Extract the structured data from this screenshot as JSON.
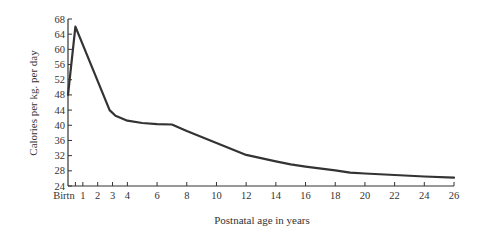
{
  "chart_data": {
    "type": "line",
    "title": "",
    "xlabel": "Postnatal age in years",
    "ylabel": "Calories per kg. per day",
    "xlim": [
      0,
      26
    ],
    "ylim": [
      24,
      68
    ],
    "grid": false,
    "legend": null,
    "x_ticks": [
      {
        "value": 0,
        "label": "Birtn"
      },
      {
        "value": 1,
        "label": "1"
      },
      {
        "value": 2,
        "label": "2"
      },
      {
        "value": 3,
        "label": "3"
      },
      {
        "value": 4,
        "label": "4"
      },
      {
        "value": 6,
        "label": "6"
      },
      {
        "value": 8,
        "label": "8"
      },
      {
        "value": 10,
        "label": "10"
      },
      {
        "value": 12,
        "label": "12"
      },
      {
        "value": 14,
        "label": "14"
      },
      {
        "value": 16,
        "label": "16"
      },
      {
        "value": 18,
        "label": "18"
      },
      {
        "value": 20,
        "label": "20"
      },
      {
        "value": 22,
        "label": "22"
      },
      {
        "value": 24,
        "label": "24"
      },
      {
        "value": 26,
        "label": "26"
      }
    ],
    "x_minor_ticks": [
      0.5
    ],
    "y_ticks": [
      24,
      28,
      32,
      36,
      40,
      44,
      48,
      52,
      56,
      60,
      64,
      68
    ],
    "series": [
      {
        "name": "Calories per kg per day",
        "color": "#333333",
        "x": [
          0,
          0.5,
          2.8,
          3.2,
          4,
          5,
          6,
          7,
          8,
          10,
          12,
          14,
          15,
          16,
          18,
          19,
          20,
          22,
          24,
          26
        ],
        "values": [
          48,
          66,
          44,
          42.5,
          41.2,
          40.6,
          40.3,
          40.2,
          38.5,
          35.3,
          32.2,
          30.5,
          29.7,
          29.1,
          28.1,
          27.5,
          27.3,
          26.9,
          26.5,
          26.2
        ]
      }
    ]
  }
}
